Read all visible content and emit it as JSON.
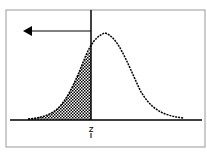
{
  "diagram": {
    "type": "normal-distribution-left-tail",
    "marker_label": "z",
    "arrow_direction": "left",
    "colors": {
      "line": "#000000",
      "background": "#ffffff",
      "border": "#888888"
    }
  }
}
